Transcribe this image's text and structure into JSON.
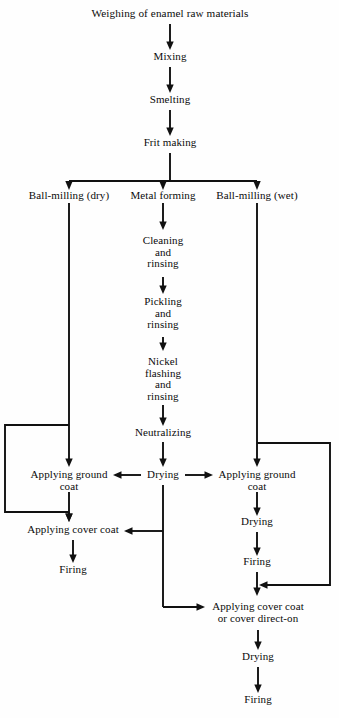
{
  "diagram": {
    "title": "Weighing of enamel raw materials",
    "type": "process-flowchart",
    "orientation": "top-to-bottom",
    "background_color": "#fefefe",
    "line_color": "#111111",
    "text_color": "#0b0b0b"
  },
  "nodes": [
    {
      "id": "weighing",
      "label": "Weighing of enamel raw materials",
      "x": 170,
      "y": 14,
      "lines": 1
    },
    {
      "id": "mixing",
      "label": "Mixing",
      "x": 170,
      "y": 57,
      "lines": 1
    },
    {
      "id": "smelting",
      "label": "Smelting",
      "x": 170,
      "y": 100,
      "lines": 1
    },
    {
      "id": "frit_making",
      "label": "Frit making",
      "x": 170,
      "y": 143,
      "lines": 1
    },
    {
      "id": "ball_dry",
      "label": "Ball-milling (dry)",
      "x": 69,
      "y": 196,
      "lines": 1
    },
    {
      "id": "metal_forming",
      "label": "Metal forming",
      "x": 163,
      "y": 196,
      "lines": 1
    },
    {
      "id": "ball_wet",
      "label": "Ball-milling (wet)",
      "x": 257,
      "y": 196,
      "lines": 1
    },
    {
      "id": "cleaning",
      "label": "Cleaning\nand\nrinsing",
      "x": 163,
      "y": 240,
      "lines": 3
    },
    {
      "id": "pickling",
      "label": "Pickling\nand\nrinsing",
      "x": 163,
      "y": 300,
      "lines": 3
    },
    {
      "id": "nickel",
      "label": "Nickel\nflashing\nand\nrinsing",
      "x": 163,
      "y": 357,
      "lines": 4
    },
    {
      "id": "neutralizing",
      "label": "Neutralizing",
      "x": 163,
      "y": 432,
      "lines": 1
    },
    {
      "id": "drying_center",
      "label": "Drying",
      "x": 163,
      "y": 473,
      "lines": 1
    },
    {
      "id": "ground_left",
      "label": "Applying ground\ncoat",
      "x": 69,
      "y": 473,
      "lines": 2
    },
    {
      "id": "ground_right",
      "label": "Applying ground\ncoat",
      "x": 257,
      "y": 473,
      "lines": 2
    },
    {
      "id": "cover_left",
      "label": "Applying cover coat",
      "x": 73,
      "y": 529,
      "lines": 1
    },
    {
      "id": "firing_left",
      "label": "Firing",
      "x": 73,
      "y": 569,
      "lines": 1
    },
    {
      "id": "drying_right",
      "label": "Drying",
      "x": 257,
      "y": 522,
      "lines": 1
    },
    {
      "id": "firing_right",
      "label": "Firing",
      "x": 257,
      "y": 562,
      "lines": 1
    },
    {
      "id": "cover_bottom",
      "label": "Applying cover coat\nor cover direct-on",
      "x": 258,
      "y": 608,
      "lines": 2
    },
    {
      "id": "drying_bottom",
      "label": "Drying",
      "x": 258,
      "y": 656,
      "lines": 1
    },
    {
      "id": "firing_bottom",
      "label": "Firing",
      "x": 258,
      "y": 700,
      "lines": 1
    }
  ],
  "connections": [
    {
      "from": "weighing",
      "to": "mixing",
      "kind": "arrow-down"
    },
    {
      "from": "mixing",
      "to": "smelting",
      "kind": "arrow-down"
    },
    {
      "from": "smelting",
      "to": "frit_making",
      "kind": "arrow-down"
    },
    {
      "from": "frit_making",
      "to": "split-bar",
      "kind": "three-way-split"
    },
    {
      "from": "split-bar",
      "to": "ball_dry",
      "kind": "arrow-down"
    },
    {
      "from": "split-bar",
      "to": "metal_forming",
      "kind": "arrow-down"
    },
    {
      "from": "split-bar",
      "to": "ball_wet",
      "kind": "arrow-down"
    },
    {
      "from": "metal_forming",
      "to": "cleaning",
      "kind": "arrow-down"
    },
    {
      "from": "cleaning",
      "to": "pickling",
      "kind": "arrow-down"
    },
    {
      "from": "pickling",
      "to": "nickel",
      "kind": "arrow-down"
    },
    {
      "from": "nickel",
      "to": "neutralizing",
      "kind": "arrow-down"
    },
    {
      "from": "neutralizing",
      "to": "drying_center",
      "kind": "arrow-down"
    },
    {
      "from": "ball_dry",
      "to": "ground_left",
      "kind": "arrow-down-long"
    },
    {
      "from": "ball_wet",
      "to": "ground_right",
      "kind": "arrow-down-long"
    },
    {
      "from": "drying_center",
      "to": "ground_left",
      "kind": "arrow-left"
    },
    {
      "from": "drying_center",
      "to": "ground_right",
      "kind": "arrow-right"
    },
    {
      "from": "ball_dry",
      "to": "cover_left",
      "kind": "bypass-left"
    },
    {
      "from": "ground_left",
      "to": "cover_left",
      "kind": "arrow-down"
    },
    {
      "from": "cover_left",
      "to": "firing_left",
      "kind": "arrow-down"
    },
    {
      "from": "drying_center",
      "to": "cover_left",
      "kind": "arrow-left-long"
    },
    {
      "from": "ground_right",
      "to": "drying_right",
      "kind": "arrow-down"
    },
    {
      "from": "drying_right",
      "to": "firing_right",
      "kind": "arrow-down"
    },
    {
      "from": "ball_wet",
      "to": "cover_bottom",
      "kind": "bypass-right"
    },
    {
      "from": "firing_right",
      "to": "cover_bottom",
      "kind": "arrow-down"
    },
    {
      "from": "drying_center",
      "to": "cover_bottom",
      "kind": "arrow-right-long"
    },
    {
      "from": "cover_bottom",
      "to": "drying_bottom",
      "kind": "arrow-down"
    },
    {
      "from": "drying_bottom",
      "to": "firing_bottom",
      "kind": "arrow-down"
    }
  ]
}
